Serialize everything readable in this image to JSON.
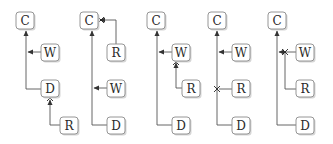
{
  "diagram": {
    "colors": {
      "box_stroke": "#8a8a8a",
      "box_fill": "#ffffff",
      "edge": "#555555",
      "text": "#2a2a2a"
    },
    "panels": [
      {
        "id": "panel-1",
        "nodes": [
          {
            "label": "C",
            "x": 16,
            "y": 12
          },
          {
            "label": "W",
            "x": 41,
            "y": 44
          },
          {
            "label": "D",
            "x": 41,
            "y": 80
          },
          {
            "label": "R",
            "x": 60,
            "y": 117
          }
        ],
        "cross_marks": [
          {
            "x": 50,
            "y": 98
          }
        ]
      },
      {
        "id": "panel-2",
        "nodes": [
          {
            "label": "C",
            "x": 80,
            "y": 12
          },
          {
            "label": "R",
            "x": 107,
            "y": 44
          },
          {
            "label": "W",
            "x": 107,
            "y": 80
          },
          {
            "label": "D",
            "x": 107,
            "y": 117
          }
        ],
        "cross_marks": [
          {
            "x": 101,
            "y": 20
          }
        ]
      },
      {
        "id": "panel-3",
        "nodes": [
          {
            "label": "C",
            "x": 147,
            "y": 12
          },
          {
            "label": "W",
            "x": 172,
            "y": 44
          },
          {
            "label": "R",
            "x": 182,
            "y": 80
          },
          {
            "label": "D",
            "x": 172,
            "y": 117
          }
        ],
        "cross_marks": [
          {
            "x": 176,
            "y": 62
          }
        ]
      },
      {
        "id": "panel-4",
        "nodes": [
          {
            "label": "C",
            "x": 208,
            "y": 12
          },
          {
            "label": "W",
            "x": 232,
            "y": 44
          },
          {
            "label": "R",
            "x": 232,
            "y": 80
          },
          {
            "label": "D",
            "x": 232,
            "y": 117
          }
        ],
        "cross_marks": [
          {
            "x": 217,
            "y": 89
          }
        ]
      },
      {
        "id": "panel-5",
        "nodes": [
          {
            "label": "C",
            "x": 268,
            "y": 12
          },
          {
            "label": "W",
            "x": 296,
            "y": 44
          },
          {
            "label": "R",
            "x": 296,
            "y": 80
          },
          {
            "label": "D",
            "x": 296,
            "y": 117
          }
        ],
        "cross_marks": [
          {
            "x": 285,
            "y": 52
          }
        ]
      }
    ]
  }
}
